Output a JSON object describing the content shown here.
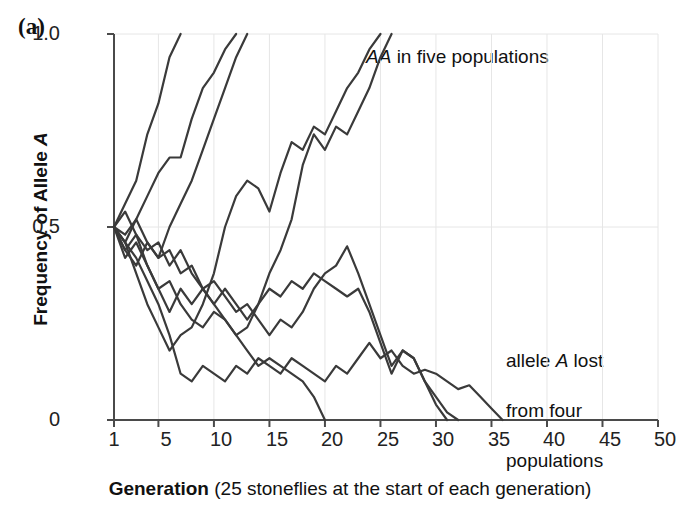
{
  "panel": {
    "label": "(a)"
  },
  "axes": {
    "y": {
      "label_prefix": "Frequency of Allele ",
      "label_italic": "A",
      "ticks": [
        "0",
        "0.5",
        "1.0"
      ],
      "tick_values": [
        0,
        0.5,
        1.0
      ],
      "range": [
        0,
        1.0
      ]
    },
    "x": {
      "label_bold": "Generation",
      "label_rest": " (25 stoneflies at the start of each generation)",
      "ticks": [
        "1",
        "5",
        "10",
        "15",
        "20",
        "25",
        "30",
        "35",
        "40",
        "45",
        "50"
      ],
      "tick_values": [
        1,
        5,
        10,
        15,
        20,
        25,
        30,
        35,
        40,
        45,
        50
      ],
      "range": [
        1,
        50
      ]
    }
  },
  "annotations": [
    {
      "id": "fixed",
      "italic": "AA",
      "text": " in five populations",
      "x": 366,
      "y": 44
    },
    {
      "id": "lost",
      "line1_a": "allele ",
      "line1_i": "A",
      "line1_b": " lost",
      "line2": "from four",
      "line3": "populations",
      "x": 506,
      "y": 323
    }
  ],
  "colors": {
    "line": "#3a3a3a",
    "axis": "#4a4a4a",
    "grid": "#e6e6e6",
    "background": "#ffffff",
    "text": "#111111"
  },
  "chart_data": {
    "type": "line",
    "title": "",
    "xlabel": "Generation (25 stoneflies at the start of each generation)",
    "ylabel": "Frequency of Allele A",
    "xlim": [
      1,
      50
    ],
    "ylim": [
      0,
      1.0
    ],
    "grid": true,
    "legend": "none",
    "x_ticks": [
      1,
      5,
      10,
      15,
      20,
      25,
      30,
      35,
      40,
      45,
      50
    ],
    "y_ticks": [
      0,
      0.5,
      1.0
    ],
    "note": "Nine replicate populations of stoneflies, each starting at allele A frequency 0.5; five fix allele A (AA) and four lose it.",
    "series": [
      {
        "name": "population-1-fixed",
        "outcome": "fixed",
        "x": [
          1,
          2,
          3,
          4,
          5,
          6,
          7
        ],
        "values": [
          0.5,
          0.56,
          0.62,
          0.74,
          0.82,
          0.94,
          1.0
        ]
      },
      {
        "name": "population-2-fixed",
        "outcome": "fixed",
        "x": [
          1,
          2,
          3,
          4,
          5,
          6,
          7,
          8,
          9,
          10,
          11,
          12
        ],
        "values": [
          0.5,
          0.46,
          0.52,
          0.58,
          0.64,
          0.68,
          0.68,
          0.78,
          0.86,
          0.9,
          0.96,
          1.0
        ]
      },
      {
        "name": "population-3-fixed",
        "outcome": "fixed",
        "x": [
          1,
          2,
          3,
          4,
          5,
          6,
          7,
          8,
          9,
          10,
          11,
          12,
          13
        ],
        "values": [
          0.5,
          0.44,
          0.4,
          0.46,
          0.42,
          0.5,
          0.56,
          0.62,
          0.7,
          0.78,
          0.86,
          0.94,
          1.0
        ]
      },
      {
        "name": "population-4-fixed",
        "outcome": "fixed",
        "x": [
          1,
          2,
          3,
          4,
          5,
          6,
          7,
          8,
          9,
          10,
          11,
          12,
          13,
          14,
          15,
          16,
          17,
          18,
          19,
          20,
          21,
          22,
          23,
          24,
          25,
          26
        ],
        "values": [
          0.5,
          0.42,
          0.46,
          0.4,
          0.34,
          0.28,
          0.34,
          0.3,
          0.34,
          0.3,
          0.26,
          0.22,
          0.24,
          0.3,
          0.38,
          0.44,
          0.52,
          0.66,
          0.74,
          0.7,
          0.76,
          0.74,
          0.8,
          0.86,
          0.94,
          1.0
        ]
      },
      {
        "name": "population-5-fixed",
        "outcome": "fixed",
        "x": [
          1,
          2,
          3,
          4,
          5,
          6,
          7,
          8,
          9,
          10,
          11,
          12,
          13,
          14,
          15,
          16,
          17,
          18,
          19,
          20,
          21,
          22,
          23,
          24,
          25
        ],
        "values": [
          0.5,
          0.46,
          0.38,
          0.3,
          0.24,
          0.18,
          0.22,
          0.24,
          0.3,
          0.38,
          0.5,
          0.58,
          0.62,
          0.6,
          0.54,
          0.64,
          0.72,
          0.7,
          0.76,
          0.74,
          0.8,
          0.86,
          0.9,
          0.96,
          1.0
        ]
      },
      {
        "name": "population-6-lost",
        "outcome": "lost",
        "x": [
          1,
          2,
          3,
          4,
          5,
          6,
          7,
          8,
          9,
          10,
          11,
          12,
          13,
          14,
          15,
          16,
          17,
          18,
          19,
          20
        ],
        "values": [
          0.5,
          0.44,
          0.48,
          0.4,
          0.34,
          0.36,
          0.3,
          0.26,
          0.24,
          0.28,
          0.26,
          0.22,
          0.18,
          0.14,
          0.16,
          0.14,
          0.12,
          0.1,
          0.06,
          0.0
        ]
      },
      {
        "name": "population-7-lost",
        "outcome": "lost",
        "x": [
          1,
          2,
          3,
          4,
          5,
          6,
          7,
          8,
          9,
          10,
          11,
          12,
          13,
          14,
          15,
          16,
          17,
          18,
          19,
          20,
          21,
          22,
          23,
          24,
          25,
          26,
          27,
          28,
          29,
          30,
          31
        ],
        "values": [
          0.5,
          0.54,
          0.48,
          0.44,
          0.46,
          0.4,
          0.44,
          0.38,
          0.34,
          0.36,
          0.32,
          0.28,
          0.3,
          0.26,
          0.22,
          0.26,
          0.24,
          0.28,
          0.34,
          0.38,
          0.4,
          0.45,
          0.38,
          0.3,
          0.22,
          0.14,
          0.18,
          0.16,
          0.1,
          0.04,
          0.0
        ]
      },
      {
        "name": "population-8-lost",
        "outcome": "lost",
        "x": [
          1,
          2,
          3,
          4,
          5,
          6,
          7,
          8,
          9,
          10,
          11,
          12,
          13,
          14,
          15,
          16,
          17,
          18,
          19,
          20,
          21,
          22,
          23,
          24,
          25,
          26,
          27,
          28,
          29,
          30,
          31,
          32
        ],
        "values": [
          0.5,
          0.48,
          0.52,
          0.46,
          0.42,
          0.44,
          0.38,
          0.4,
          0.34,
          0.3,
          0.34,
          0.3,
          0.26,
          0.3,
          0.34,
          0.32,
          0.36,
          0.34,
          0.38,
          0.36,
          0.34,
          0.32,
          0.34,
          0.28,
          0.2,
          0.12,
          0.18,
          0.16,
          0.1,
          0.06,
          0.02,
          0.0
        ]
      },
      {
        "name": "population-9-lost",
        "outcome": "lost",
        "x": [
          1,
          2,
          3,
          4,
          5,
          6,
          7,
          8,
          9,
          10,
          11,
          12,
          13,
          14,
          15,
          16,
          17,
          18,
          19,
          20,
          21,
          22,
          23,
          24,
          25,
          26,
          27,
          28,
          29,
          30,
          31,
          32,
          33,
          34,
          35,
          36
        ],
        "values": [
          0.5,
          0.46,
          0.42,
          0.36,
          0.3,
          0.22,
          0.12,
          0.1,
          0.14,
          0.12,
          0.1,
          0.14,
          0.12,
          0.16,
          0.14,
          0.12,
          0.16,
          0.14,
          0.12,
          0.1,
          0.14,
          0.12,
          0.16,
          0.2,
          0.16,
          0.18,
          0.14,
          0.12,
          0.13,
          0.12,
          0.1,
          0.08,
          0.09,
          0.06,
          0.03,
          0.0
        ]
      }
    ]
  }
}
